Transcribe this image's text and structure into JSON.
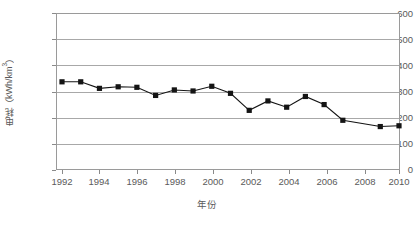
{
  "chart_data": {
    "type": "line",
    "title": "",
    "xlabel": "年份",
    "ylabel": "电耗（kWh/km³）",
    "ylabel_main": "电耗（kWh/km",
    "ylabel_exp": "3",
    "ylabel_tail": "）",
    "xlim": [
      1992,
      2010
    ],
    "ylim": [
      0,
      600
    ],
    "y_ticks": [
      0,
      100,
      200,
      300,
      400,
      500,
      600
    ],
    "y_tick_labels": [
      "0",
      "100",
      "200",
      "300",
      "400",
      "500",
      "600"
    ],
    "x_ticks": [
      1992,
      1994,
      1996,
      1998,
      2000,
      2002,
      2004,
      2006,
      2008,
      2010
    ],
    "x_tick_labels": [
      "1992",
      "1994",
      "1996",
      "1998",
      "2000",
      "2002",
      "2004",
      "2006",
      "2008",
      "2010"
    ],
    "grid": "horizontal",
    "legend": "none",
    "marker": "square",
    "marker_color": "#141414",
    "line_color": "#141414",
    "x": [
      1992,
      1993,
      1994,
      1995,
      1996,
      1997,
      1998,
      1999,
      2000,
      2001,
      2002,
      2003,
      2004,
      2005,
      2006,
      2007,
      2009,
      2010
    ],
    "values": [
      337,
      337,
      312,
      318,
      316,
      285,
      306,
      302,
      320,
      293,
      228,
      264,
      240,
      281,
      250,
      190,
      166,
      169
    ],
    "series": [
      {
        "name": "电耗",
        "categories": [
          "1992",
          "1993",
          "1994",
          "1995",
          "1996",
          "1997",
          "1998",
          "1999",
          "2000",
          "2001",
          "2002",
          "2003",
          "2004",
          "2005",
          "2006",
          "2007",
          "2009",
          "2010"
        ],
        "values": [
          337,
          337,
          312,
          318,
          316,
          285,
          306,
          302,
          320,
          293,
          228,
          264,
          240,
          281,
          250,
          190,
          166,
          169
        ]
      }
    ]
  },
  "axis": {
    "x_title": "年份",
    "y_title": "电耗（kWh/km³）"
  },
  "caption": {
    "text": ""
  }
}
